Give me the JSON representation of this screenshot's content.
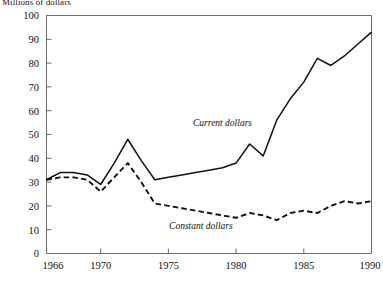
{
  "figure": {
    "unit_label": "Millions of dollars",
    "axis_color": "#6a6a6a",
    "line_color": "#101010"
  },
  "chart_data": {
    "type": "line",
    "title": "",
    "subtitle": "",
    "xlabel": "",
    "ylabel": "Millions of dollars",
    "xlim": [
      1966,
      1990
    ],
    "ylim": [
      0,
      100
    ],
    "grid": false,
    "legend_position": "inline-annotation",
    "xticks": [
      1966,
      1970,
      1975,
      1980,
      1985,
      1990
    ],
    "xtick_labels": [
      "1966",
      "1970",
      "1975",
      "1980",
      "1985",
      "1990"
    ],
    "yticks": [
      0,
      10,
      20,
      30,
      40,
      50,
      60,
      70,
      80,
      90,
      100
    ],
    "ytick_labels": [
      "0",
      "10",
      "20",
      "30",
      "40",
      "50",
      "60",
      "70",
      "80",
      "90",
      "100"
    ],
    "x": [
      1966,
      1967,
      1968,
      1969,
      1970,
      1971,
      1972,
      1973,
      1974,
      1975,
      1976,
      1977,
      1978,
      1979,
      1980,
      1981,
      1982,
      1983,
      1984,
      1985,
      1986,
      1987,
      1988,
      1989,
      1990
    ],
    "series": [
      {
        "name": "Current dollars",
        "style": "solid",
        "label": "Current dollars",
        "label_x": 1979.0,
        "label_y": 53.5,
        "values": [
          31,
          34,
          34,
          33,
          29,
          38,
          48,
          39,
          31,
          32,
          33,
          34,
          35,
          36,
          38,
          46,
          41,
          56,
          65,
          72,
          82,
          79,
          83,
          88,
          93
        ]
      },
      {
        "name": "Constant dollars",
        "style": "dashed",
        "label": "Constant dollars",
        "label_x": 1977.4,
        "label_y": 10.5,
        "values": [
          31,
          32,
          32,
          31,
          26,
          32,
          38,
          30,
          21,
          20,
          19,
          18,
          17,
          16,
          15,
          17,
          16,
          14,
          17,
          18,
          17,
          20,
          22,
          21,
          22
        ]
      }
    ]
  }
}
